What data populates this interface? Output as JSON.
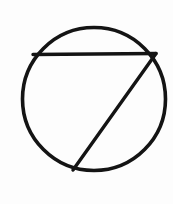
{
  "page": {
    "background_color": "#fdfdfd",
    "width": 173,
    "height": 204
  },
  "drawing": {
    "description": "Hand-drawn black line figure: a circle containing a horizontal chord near the top and a diagonal line running from the chord's right endpoint down to the bottom of the circle, resembling the numeral seven.",
    "ink_color": "#141414",
    "style": "line-art",
    "shapes": [
      {
        "name": "outer-circle",
        "type": "circle",
        "cx": 94,
        "cy": 99,
        "r": 71.5,
        "stroke_width": 3.6
      },
      {
        "name": "horizontal-chord",
        "type": "line",
        "x1": 33,
        "y1": 54.5,
        "x2": 156,
        "y2": 53.5,
        "stroke_width": 3.4
      },
      {
        "name": "diagonal-stroke",
        "type": "line",
        "x1": 156,
        "y1": 53.5,
        "x2": 73,
        "y2": 170,
        "stroke_width": 3.4
      }
    ]
  }
}
